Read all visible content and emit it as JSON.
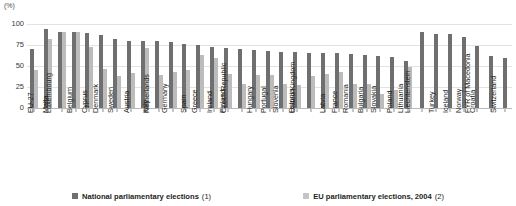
{
  "chart_data": {
    "type": "bar",
    "title": "",
    "subtitle": "",
    "unit_label": "(%)",
    "xlabel": "",
    "ylabel": "",
    "ylim": [
      0,
      100
    ],
    "yticks": [
      0,
      25,
      50,
      75,
      100
    ],
    "grid": true,
    "legend_position": "bottom",
    "categories": [
      "EU-27",
      "Malta",
      "Luxembourg",
      "Belgium",
      "Cyprus",
      "Denmark",
      "Sweden",
      "Austria",
      "Italy",
      "Netherlands",
      "Germany",
      "Spain",
      "Greece",
      "Ireland",
      "Finland",
      "Czech Republic",
      "Hungary",
      "Portugal",
      "Slovenia",
      "Estonia",
      "United Kingdom",
      "Latvia",
      "France",
      "Romania",
      "Bulgaria",
      "Slovakia",
      "Poland",
      "Lithuania",
      "Liechtenstein",
      "Turkey",
      "Iceland",
      "Norway",
      "Croatia",
      "FYR of Macedonia",
      "Switzerland"
    ],
    "series": [
      {
        "name": "National parliamentary elections (1)",
        "note": "(1)",
        "label": "National parliamentary elections",
        "color": "#6f6f6f",
        "values": [
          70,
          94,
          91,
          91,
          89,
          87,
          82,
          80,
          80,
          80,
          78,
          76,
          75,
          73,
          72,
          70,
          69,
          68,
          67,
          67,
          66,
          65,
          65,
          64,
          63,
          62,
          61,
          56,
          90,
          88,
          88,
          84,
          74,
          62,
          59
        ]
      },
      {
        "name": "EU parliamentary elections, 2004 (2)",
        "note": "(2)",
        "label": "EU parliamentary elections, 2004",
        "color": "#bcbcbc",
        "values": [
          45,
          82,
          90,
          91,
          73,
          47,
          38,
          42,
          72,
          39,
          43,
          45,
          63,
          59,
          41,
          28,
          39,
          39,
          28,
          27,
          38,
          41,
          43,
          29,
          29,
          17,
          21,
          49,
          null,
          null,
          null,
          null,
          null,
          null,
          null
        ]
      }
    ]
  },
  "legend": {
    "items": [
      {
        "label": "National parliamentary elections",
        "note": "(1)",
        "color": "#6f6f6f"
      },
      {
        "label": "EU parliamentary elections, 2004",
        "note": "(2)",
        "color": "#c4c4c4"
      }
    ]
  }
}
